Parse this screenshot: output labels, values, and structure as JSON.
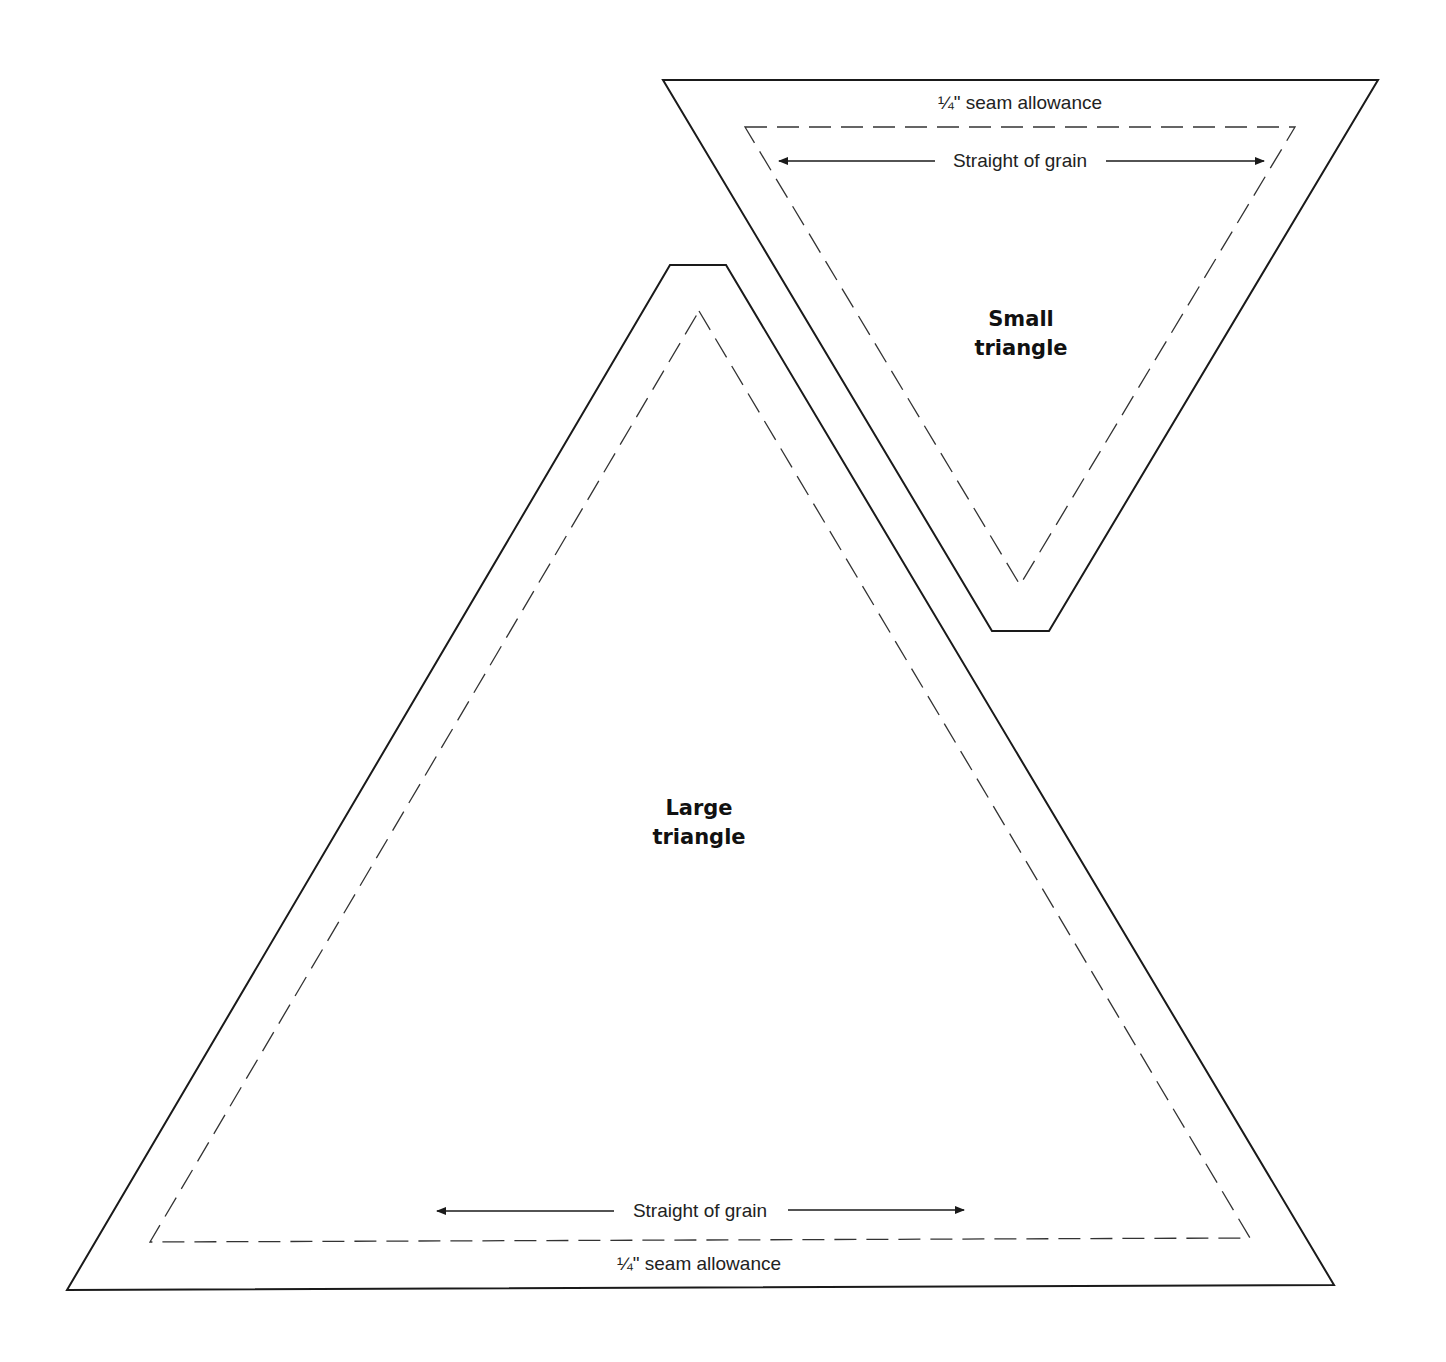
{
  "diagram": {
    "type": "quilt-pattern-templates",
    "colors": {
      "background": "#ffffff",
      "line": "#1a1a1a"
    },
    "small_triangle": {
      "title_line1": "Small",
      "title_line2": "triangle",
      "seam_label": "¼\" seam allowance",
      "grain_label": "Straight of grain",
      "orientation": "point-down"
    },
    "large_triangle": {
      "title_line1": "Large",
      "title_line2": "triangle",
      "seam_label": "¼\" seam allowance",
      "grain_label": "Straight of grain",
      "orientation": "point-up"
    }
  }
}
